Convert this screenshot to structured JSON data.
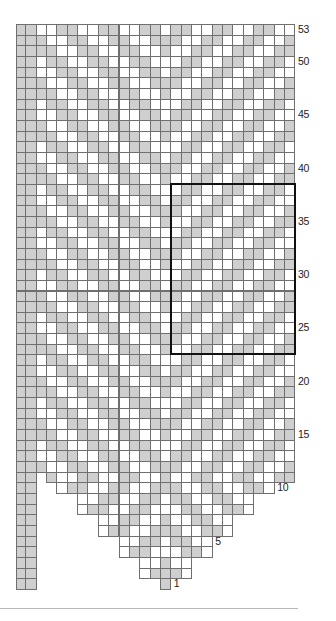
{
  "chart_data": {
    "type": "table",
    "legend": {
      "G": "grey (contrast) stitch",
      "W": "white (main) stitch",
      ".": "no stitch"
    },
    "columns": 27,
    "rows_count": 53,
    "row_order": "top-to-bottom, row 53 first",
    "rows": [
      "GGWWGGWWGGWWGGWGGWWGGWWGGWW",
      "GGGWWGGWWGGWWGGGWWGGWWGGWWG",
      "GGGGWWGGWWGGWWGWWGGWWGGWWGG",
      "GGWGGWWGGWWGGWWWGGWWGGWWGGW",
      "GGWWGGWWGGWWGGWGGWWGGWWGGWW",
      "GGGWWGGWWGGWWGGGWWGGWWGGWWG",
      "GGGGWWGGWWGGWWGWWGGWWGGWWGG",
      "GGWGGWWGGWWGGWWWGGWWGGWWGGW",
      "GGWWGGWWGGWWGGWGGWWGGWWGGWW",
      "GGGWWGGWWGGWWGGGWWGGWWGGWWG",
      "GGGGWWGGWWGGWWGWWGGWWGGWWGG",
      "GGWGGWWGGWWGGWWWGGWWGGWWGGW",
      "GGWWGGWWGGWWGGWGGWWGGWWGGWW",
      "GGGWWGGWWGGWWGGGWWGGWWGGWWG",
      "GGGGWWGGWWGGWWGWWGGWWGGWWGG",
      "GGWGGWWGGWWGGWWWGGWWGGWWGGW",
      "GGWWGGWWGGWWGGWGGWWGGWWGGWW",
      "GGGWWGGWWGGWWGGGWWGGWWGGWWG",
      "GGGGWWGGWWGGWWGWWGGWWGGWWGG",
      "GGWGGWWGGWWGGWWWGGWWGGWWGGW",
      "GGWWGGWWGGWWGGWGGWWGGWWGGWW",
      "GGGWWGGWWGGWWGGGWWGGWWGGWWG",
      "GGGGWWGGWWGGWWGWWGGWWGGWWGG",
      "GGWGGWWGGWWGGWWWGGWWGGWWGGW",
      "GGWWGGWWGGWWGGWGGWWGGWWGGWW",
      "GGGWWGGWWGGWWGGGWWGGWWGGWWG",
      "GGGGWWGGWWGGWWGWWGGWWGGWWGG",
      "GGWGGWWGGWWGGWWWGGWWGGWWGGW",
      "GGWWGGWWGGWWGGWGGWWGGWWGGWW",
      "GGGWWGGWWGGWWGGGWWGGWWGGWWG",
      "GGGGWWGGWWGGWWGWWGGWWGGWWGG",
      "GGWGGWWGGWWGGWWWGGWWGGWWGGW",
      "GGWWGGWWGGWWGGWGGWWGGWWGGWW",
      "GGGWWGGWWGGWWGGGWWGGWWGGWWG",
      "GGGGWWGGWWGGWWGWWGGWWGGWWGG",
      "GGWGGWWGGWWGGWWWGGWWGGWWGGW",
      "GGWWGGWWGGWWGGWGGWWGGWWGGWW",
      "GGGWWGGWWGGWWGGGWWGGWWGGWWG",
      "GGGGWWGGWWGGWWGWWGGWWGGWWGG",
      "GGWGGWWGGWWGGWWWGGWWGGWWGGW",
      "GGWWGGWWGGWWGGWGGWWGGWWGGWW",
      "GGGWWGGWWGGWWGGGWWGGWWGGWWG",
      "GG.GWWGGWWGGWWGWWGGWWGGWWGG",
      "GG..WGGWWGGWWGGGWWGGWWGGW..",
      "GG....WWGGWWGGWGGWWGGWW....",
      "GG....WGGWWGGWWWGGWWGGW....",
      "GG......WWGGWWGWWGGWW......",
      "GG......WGGWWGGGWWGGW......",
      "GG........WWGGWGGWW........",
      "GG........WGGWWWGGW........",
      "GG..........WWGWW..........",
      "GG..........WGGGW..........",
      "GG............G............"
    ],
    "row_labels": [
      {
        "row": 53,
        "text": "53"
      },
      {
        "row": 50,
        "text": "50"
      },
      {
        "row": 45,
        "text": "45"
      },
      {
        "row": 40,
        "text": "40"
      },
      {
        "row": 35,
        "text": "35"
      },
      {
        "row": 30,
        "text": "30"
      },
      {
        "row": 25,
        "text": "25"
      },
      {
        "row": 20,
        "text": "20"
      },
      {
        "row": 15,
        "text": "15"
      },
      {
        "row": 10,
        "text": "10"
      },
      {
        "row": 5,
        "text": "5"
      },
      {
        "row": 1,
        "text": "1"
      }
    ],
    "highlight_box": {
      "col_start": 16,
      "col_end": 27,
      "row_start": 23,
      "row_end": 38,
      "label": "repeat"
    },
    "colors": {
      "grey": "#cfcfcf",
      "white": "#ffffff",
      "gridline": "#6f6f6f",
      "box": "#111111"
    }
  }
}
